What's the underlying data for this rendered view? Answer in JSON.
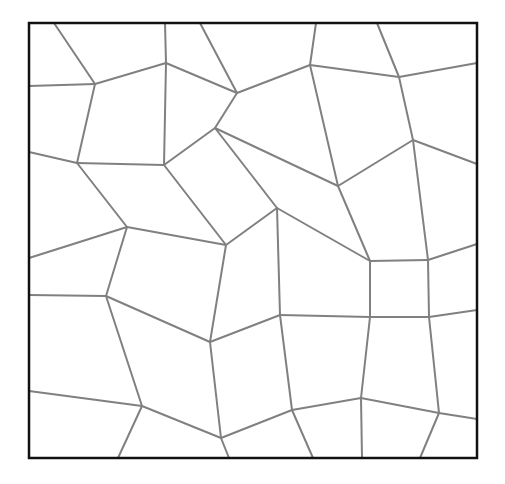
{
  "diagram": {
    "type": "voronoi-tessellation",
    "colors": {
      "background": "#ffffff",
      "frame": "#111111",
      "edges": "#808080"
    },
    "frame": {
      "x": 29,
      "y": 23,
      "width": 448,
      "height": 435
    },
    "edges": [
      [
        54,
        23,
        95,
        84
      ],
      [
        29,
        86,
        95,
        84
      ],
      [
        95,
        84,
        166,
        63
      ],
      [
        165,
        23,
        166,
        63
      ],
      [
        166,
        63,
        237,
        93
      ],
      [
        200,
        23,
        237,
        93
      ],
      [
        237,
        93,
        310,
        65
      ],
      [
        237,
        93,
        215,
        128
      ],
      [
        95,
        84,
        77,
        163
      ],
      [
        29,
        152,
        77,
        163
      ],
      [
        77,
        163,
        164,
        165
      ],
      [
        166,
        63,
        164,
        165
      ],
      [
        164,
        165,
        215,
        128
      ],
      [
        215,
        128,
        338,
        186
      ],
      [
        215,
        128,
        277,
        208
      ],
      [
        164,
        165,
        226,
        245
      ],
      [
        77,
        163,
        127,
        227
      ],
      [
        127,
        227,
        226,
        245
      ],
      [
        29,
        258,
        127,
        227
      ],
      [
        127,
        227,
        106,
        296
      ],
      [
        29,
        295,
        106,
        296
      ],
      [
        106,
        296,
        210,
        342
      ],
      [
        226,
        245,
        277,
        208
      ],
      [
        226,
        245,
        210,
        342
      ],
      [
        316,
        23,
        310,
        65
      ],
      [
        310,
        65,
        399,
        77
      ],
      [
        377,
        23,
        399,
        77
      ],
      [
        399,
        77,
        477,
        63
      ],
      [
        399,
        77,
        413,
        140
      ],
      [
        413,
        140,
        477,
        164
      ],
      [
        413,
        140,
        338,
        186
      ],
      [
        310,
        65,
        338,
        186
      ],
      [
        338,
        186,
        370,
        261
      ],
      [
        277,
        208,
        370,
        261
      ],
      [
        277,
        208,
        280,
        315
      ],
      [
        370,
        261,
        428,
        260
      ],
      [
        413,
        140,
        428,
        260
      ],
      [
        428,
        260,
        477,
        244
      ],
      [
        370,
        261,
        370,
        317
      ],
      [
        428,
        260,
        429,
        317
      ],
      [
        280,
        315,
        370,
        317
      ],
      [
        370,
        317,
        429,
        317
      ],
      [
        429,
        317,
        477,
        310
      ],
      [
        210,
        342,
        280,
        315
      ],
      [
        210,
        342,
        221,
        438
      ],
      [
        142,
        406,
        221,
        438
      ],
      [
        29,
        391,
        142,
        406
      ],
      [
        106,
        296,
        142,
        406
      ],
      [
        142,
        406,
        118,
        458
      ],
      [
        221,
        438,
        229,
        458
      ],
      [
        221,
        438,
        292,
        410
      ],
      [
        280,
        315,
        292,
        410
      ],
      [
        292,
        410,
        313,
        458
      ],
      [
        292,
        410,
        361,
        398
      ],
      [
        370,
        317,
        361,
        398
      ],
      [
        361,
        398,
        362,
        458
      ],
      [
        361,
        398,
        439,
        413
      ],
      [
        429,
        317,
        439,
        413
      ],
      [
        439,
        413,
        477,
        419
      ],
      [
        439,
        413,
        420,
        458
      ]
    ]
  }
}
